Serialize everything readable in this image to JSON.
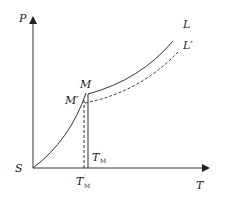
{
  "diagram": {
    "type": "phase-diagram",
    "axes": {
      "y_label": "P",
      "x_label": "T",
      "origin_label": "S"
    },
    "curves": [
      {
        "name": "L",
        "style": "solid",
        "label": "L"
      },
      {
        "name": "L'",
        "style": "dashed",
        "label": "L′"
      }
    ],
    "points": {
      "M": "M",
      "M_prime": "M′"
    },
    "temperature_markers": {
      "T_M": {
        "main": "T",
        "sub": "M"
      },
      "T_M_prime": {
        "main": "T",
        "prime": "′",
        "sub": "M"
      }
    },
    "colors": {
      "line": "#333333",
      "background": "#ffffff"
    }
  }
}
